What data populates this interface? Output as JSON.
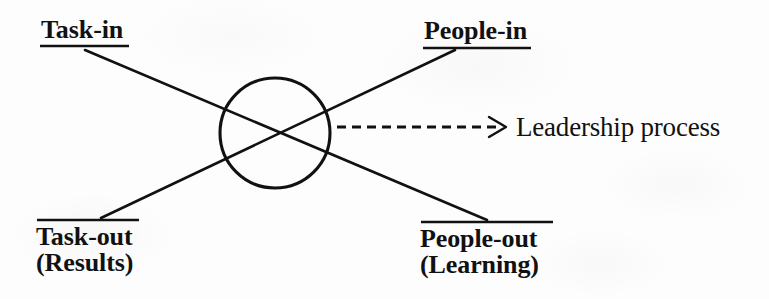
{
  "diagram": {
    "background_color": "#fdfdfd",
    "ink_color": "#111111",
    "nodes": {
      "task_in": {
        "label": "Task-in",
        "rule": "underline",
        "position": "top-left"
      },
      "people_in": {
        "label": "People-in",
        "rule": "underline",
        "position": "top-right"
      },
      "task_out": {
        "label": "Task-out",
        "sublabel": "(Results)",
        "rule": "overline",
        "position": "bottom-left"
      },
      "people_out": {
        "label": "People-out",
        "sublabel": "(Learning)",
        "rule": "overline",
        "position": "bottom-right"
      }
    },
    "center": {
      "shape": "circle",
      "cx": 275,
      "cy": 133,
      "r": 55
    },
    "connectors": [
      {
        "from": "task_in",
        "to": "people_out",
        "style": "solid"
      },
      {
        "from": "people_in",
        "to": "task_out",
        "style": "solid"
      }
    ],
    "process_arrow": {
      "label": "Leadership process",
      "style": "dashed",
      "direction": "right",
      "from_x": 337,
      "to_x": 506,
      "y": 127
    }
  }
}
